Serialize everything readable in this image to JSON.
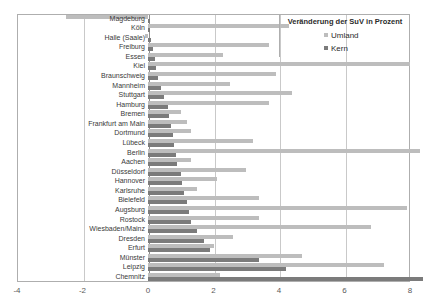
{
  "chart_data": {
    "type": "bar",
    "orientation": "horizontal",
    "title": "Veränderung der SuV in Prozent",
    "xlabel": "",
    "ylabel": "",
    "xlim": [
      -4,
      8
    ],
    "xticks": [
      -4,
      -2,
      0,
      2,
      4,
      6,
      8
    ],
    "xtick_labels": [
      "-4",
      "-2",
      "0",
      "2",
      "4",
      "6",
      "8"
    ],
    "grid": true,
    "legend_position": "top-right",
    "categories": [
      "Magdeburg",
      "Köln",
      "Halle (Saale)",
      "Freiburg",
      "Essen",
      "Kiel",
      "Braunschweig",
      "Mannheim",
      "Stuttgart",
      "Hamburg",
      "Bremen",
      "Frankfurt am Main",
      "Dortmund",
      "Lübeck",
      "Berlin",
      "Aachen",
      "Düsseldorf",
      "Hannover",
      "Karlsruhe",
      "Bielefeld",
      "Augsburg",
      "Rostock",
      "Wiesbaden/Mainz",
      "Dresden",
      "Erfurt",
      "Münster",
      "Leipzig",
      "Chemnitz"
    ],
    "series": [
      {
        "name": "Umland",
        "color": "#bdbdbd",
        "values": [
          -2.5,
          4.3,
          -0.1,
          3.7,
          2.3,
          8.0,
          3.9,
          2.5,
          4.4,
          3.7,
          1.0,
          1.2,
          1.3,
          3.2,
          8.3,
          1.3,
          3.0,
          2.1,
          1.5,
          3.4,
          7.9,
          3.4,
          6.8,
          2.6,
          2.0,
          4.7,
          7.2,
          2.2
        ]
      },
      {
        "name": "Kern",
        "color": "#7b7b7b",
        "values": [
          0.05,
          0.05,
          0.1,
          0.15,
          0.2,
          0.25,
          0.3,
          0.4,
          0.5,
          0.6,
          0.65,
          0.7,
          0.75,
          0.8,
          0.85,
          0.9,
          1.0,
          1.05,
          1.1,
          1.2,
          1.25,
          1.3,
          1.5,
          1.7,
          1.9,
          3.4,
          4.2,
          8.4
        ]
      }
    ]
  },
  "legend": {
    "title": "Veränderung der SuV in Prozent",
    "items": [
      {
        "label": "Umland",
        "color": "#bdbdbd"
      },
      {
        "label": "Kern",
        "color": "#7b7b7b"
      }
    ]
  }
}
